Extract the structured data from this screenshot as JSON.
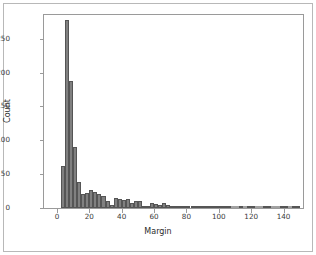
{
  "figure": {
    "background_color": "#ffffff",
    "frame_color": "#9a9a9a",
    "outer_border_color": "#b8b8b8",
    "bar_fill_color": "#808080",
    "bar_edge_color": "#555555"
  },
  "chart_data": {
    "type": "bar",
    "title": "",
    "subtitle": "",
    "xlabel": "Margin",
    "ylabel": "Count",
    "xlim": [
      -8,
      152
    ],
    "ylim": [
      0,
      285
    ],
    "xticks": [
      0,
      20,
      40,
      60,
      80,
      100,
      120,
      140
    ],
    "xtick_labels": [
      "0",
      "20",
      "40",
      "60",
      "80",
      "100",
      "120",
      "140"
    ],
    "yticks": [
      0,
      50,
      100,
      150,
      200,
      250
    ],
    "ytick_labels": [
      "0",
      "50",
      "100",
      "150",
      "200",
      "250"
    ],
    "grid": false,
    "legend": null,
    "bin_width": 2.5,
    "bin_starts": [
      2.5,
      5.0,
      7.5,
      10.0,
      12.5,
      15.0,
      17.5,
      20.0,
      22.5,
      25.0,
      27.5,
      30.0,
      32.5,
      35.0,
      37.5,
      40.0,
      42.5,
      45.0,
      47.5,
      50.0,
      52.5,
      55.0,
      57.5,
      60.0,
      62.5,
      65.0,
      67.5,
      70.0,
      72.5,
      75.0,
      77.5,
      80.0,
      82.5,
      85.0,
      87.5,
      90.0,
      92.5,
      95.0,
      97.5,
      100.0,
      102.5,
      105.0,
      107.5,
      110.0,
      112.5,
      115.0,
      117.5,
      120.0,
      122.5,
      125.0,
      127.5,
      130.0,
      132.5,
      135.0,
      137.5,
      140.0,
      142.5,
      145.0,
      147.5
    ],
    "values": [
      62,
      277,
      188,
      90,
      38,
      20,
      22,
      27,
      24,
      21,
      18,
      10,
      5,
      15,
      14,
      12,
      13,
      8,
      10,
      10,
      3,
      2,
      7,
      6,
      4,
      7,
      4,
      2,
      3,
      2,
      2,
      3,
      3,
      3,
      3,
      2,
      3,
      2,
      1,
      2,
      1,
      1,
      0,
      0,
      1,
      0,
      1,
      1,
      0,
      0,
      1,
      1,
      0,
      0,
      1,
      1,
      0,
      2,
      1
    ],
    "max_value": 277,
    "peak_bin": "5.0-7.5"
  }
}
